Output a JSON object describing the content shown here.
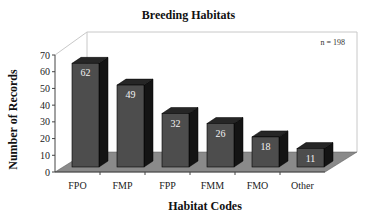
{
  "chart_data": {
    "type": "bar",
    "title": "Breeding Habitats",
    "xlabel": "Habitat Codes",
    "ylabel": "Number of Records",
    "categories": [
      "FPO",
      "FMP",
      "FPP",
      "FMM",
      "FMO",
      "Other"
    ],
    "values": [
      62,
      49,
      32,
      26,
      18,
      11
    ],
    "ylim": [
      0,
      70
    ],
    "yticks": [
      0,
      10,
      20,
      30,
      40,
      50,
      60,
      70
    ],
    "annotation": "n = 198",
    "data_labels": true,
    "style": "3d",
    "grid": false,
    "legend": null
  },
  "colors": {
    "bar_front": "#4d4d4d",
    "bar_side": "#141414",
    "bar_top": "#262626",
    "floor": "#8a8a8a",
    "wall_line": "#c8c8c8",
    "label_text": "#f2f2f2"
  }
}
